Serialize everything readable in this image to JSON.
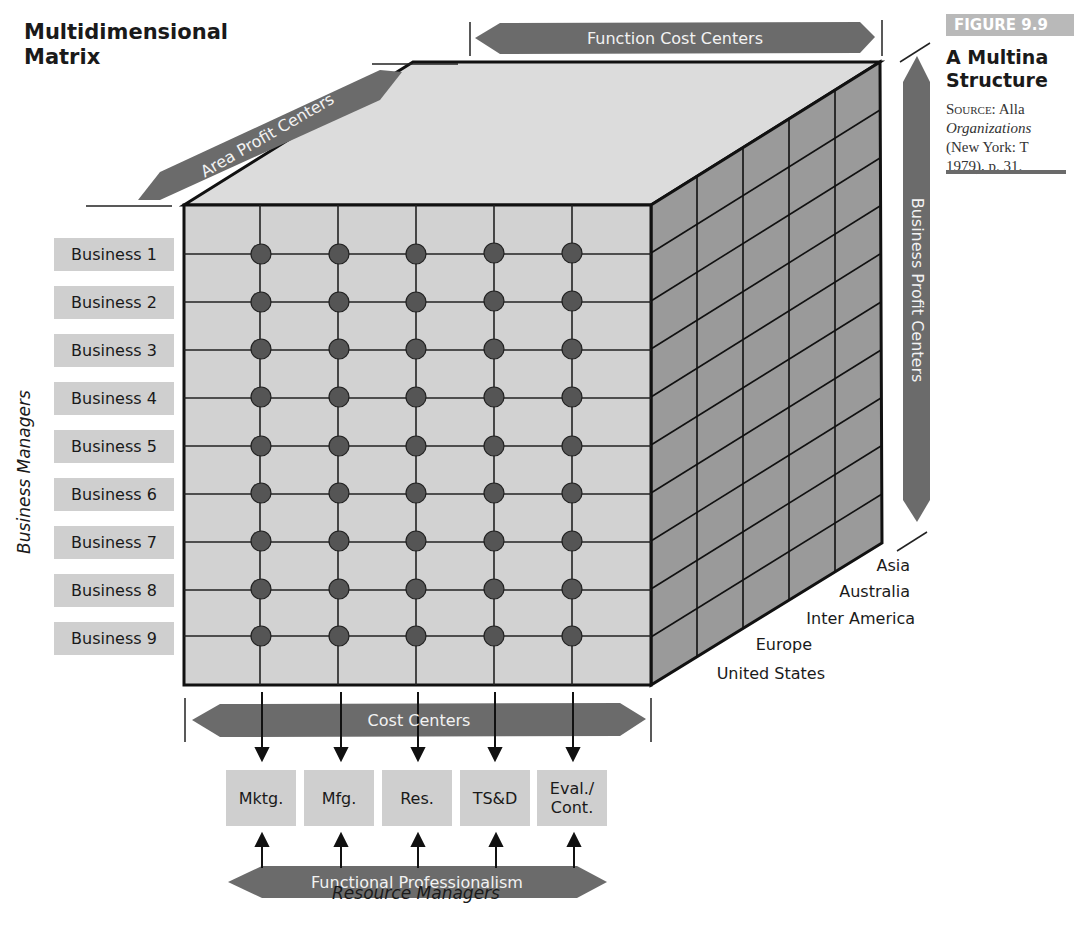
{
  "title": {
    "line1": "Multidimensional",
    "line2": "Matrix"
  },
  "figure": {
    "tag": "FIGURE 9.9",
    "title_line1": "A Multina",
    "title_line2": "Structure",
    "source_label": "Source:",
    "source_author": "Alla",
    "source_line2": "Organizations",
    "source_line3": "(New York: T",
    "source_line4": "1979), p. 31."
  },
  "arrows": {
    "top": "Function Cost Centers",
    "diagonal": "Area Profit Centers",
    "right": "Business Profit Centers",
    "cost": "Cost Centers",
    "bottom": "Functional Professionalism"
  },
  "axis_labels": {
    "left": "Business Managers",
    "bottom": "Resource Managers"
  },
  "businesses": [
    "Business 1",
    "Business 2",
    "Business 3",
    "Business 4",
    "Business 5",
    "Business 6",
    "Business 7",
    "Business 8",
    "Business 9"
  ],
  "regions": [
    "Asia",
    "Australia",
    "Inter America",
    "Europe",
    "United States"
  ],
  "functions": [
    {
      "line1": "Mktg.",
      "line2": ""
    },
    {
      "line1": "Mfg.",
      "line2": ""
    },
    {
      "line1": "Res.",
      "line2": ""
    },
    {
      "line1": "TS&D",
      "line2": ""
    },
    {
      "line1": "Eval./",
      "line2": "Cont."
    }
  ],
  "colors": {
    "label_box": "#cfcfcf",
    "arrow": "#6b6b6b",
    "front_face": "#d2d2d2",
    "top_face": "#dcdcdc",
    "side_face": "#9a9a9a",
    "node": "#555555"
  }
}
